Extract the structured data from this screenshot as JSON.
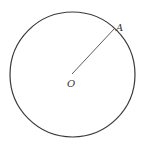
{
  "diagram": {
    "type": "circle-with-radius",
    "stroke_color": "#3a3a3a",
    "background": "#ffffff",
    "circle": {
      "cx": 72.5,
      "cy": 74.5,
      "r": 62.5
    },
    "center_point": {
      "label": "O",
      "x": 72,
      "y": 74
    },
    "point_on_circle": {
      "label": "A",
      "x": 114.5,
      "y": 28.5
    },
    "segment": {
      "from": "O",
      "to": "A"
    }
  }
}
